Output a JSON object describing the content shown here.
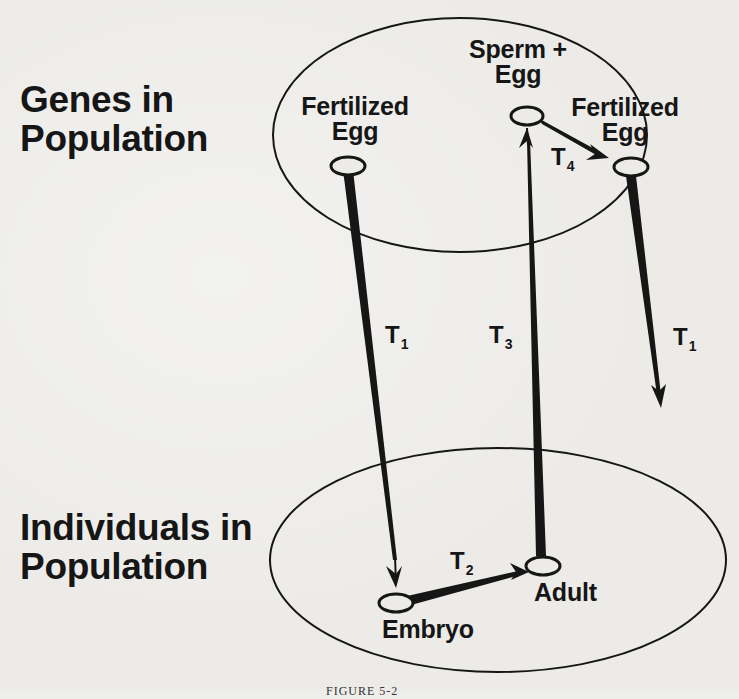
{
  "diagram": {
    "type": "life-cycle transformation diagram",
    "regions": {
      "genes": {
        "label_line1": "Genes in",
        "label_line2": "Population"
      },
      "individuals": {
        "label_line1": "Individuals in",
        "label_line2": "Population"
      }
    },
    "nodes": {
      "fertilized_egg_left": {
        "line1": "Fertilized",
        "line2": "Egg"
      },
      "sperm_egg": {
        "line1": "Sperm +",
        "line2": "Egg"
      },
      "fertilized_egg_right": {
        "line1": "Fertilized",
        "line2": "Egg"
      },
      "embryo": {
        "label": "Embryo"
      },
      "adult": {
        "label": "Adult"
      }
    },
    "transitions": {
      "t1_left": {
        "letter": "T",
        "subscript": "1",
        "from": "Fertilized Egg",
        "to": "Embryo"
      },
      "t2": {
        "letter": "T",
        "subscript": "2",
        "from": "Embryo",
        "to": "Adult"
      },
      "t3": {
        "letter": "T",
        "subscript": "3",
        "from": "Adult",
        "to": "Sperm + Egg"
      },
      "t4": {
        "letter": "T",
        "subscript": "4",
        "from": "Sperm + Egg",
        "to": "Fertilized Egg"
      },
      "t1_right": {
        "letter": "T",
        "subscript": "1",
        "from": "Fertilized Egg",
        "to": "(next cycle)"
      }
    },
    "caption": "FIGURE 5-2"
  },
  "colors": {
    "background": "#ecebe8",
    "ink": "#161616"
  }
}
